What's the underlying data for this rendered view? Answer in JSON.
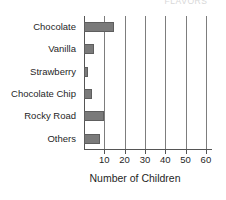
{
  "clipped_title": "FLAVORS",
  "chart_data": {
    "type": "bar",
    "orientation": "horizontal",
    "title": "",
    "categories": [
      "Chocolate",
      "Vanilla",
      "Strawberry",
      "Chocolate Chip",
      "Rocky Road",
      "Others"
    ],
    "values": [
      15,
      5,
      2,
      4,
      10,
      8
    ],
    "series": [
      {
        "name": "Number of Children",
        "values": [
          15,
          5,
          2,
          4,
          10,
          8
        ]
      }
    ],
    "xlabel": "Number of Children",
    "ylabel": "",
    "xlim": [
      0,
      63
    ],
    "xticks": [
      10,
      20,
      30,
      40,
      50,
      60
    ],
    "xtick_labels": [
      "10",
      "20",
      "30",
      "40",
      "50",
      "60"
    ],
    "grid": "vertical",
    "legend": "none",
    "bar_color": "#7a7a7a",
    "bar_edge_color": "#5e5e5e",
    "axis_color": "#555555",
    "gridline_color": "#7d7d7d",
    "background_color": "#ffffff"
  }
}
